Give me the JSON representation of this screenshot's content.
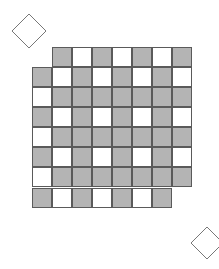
{
  "figure": {
    "colors": {
      "gray": "#b4b4b4",
      "white": "#ffffff",
      "border": "#5a5a5a",
      "diamond_stroke": "#777777"
    },
    "cell_size": 20,
    "grid_origin": {
      "x": 32,
      "y": 47
    },
    "rows": [
      {
        "start_col": 1,
        "cells": [
          "G",
          "W",
          "G",
          "W",
          "G",
          "W",
          "G"
        ]
      },
      {
        "start_col": 0,
        "cells": [
          "G",
          "W",
          "G",
          "W",
          "G",
          "W",
          "G",
          "W"
        ]
      },
      {
        "start_col": 0,
        "cells": [
          "W",
          "G",
          "G",
          "G",
          "G",
          "G",
          "G",
          "G"
        ]
      },
      {
        "start_col": 0,
        "cells": [
          "G",
          "W",
          "G",
          "W",
          "G",
          "W",
          "G",
          "W"
        ]
      },
      {
        "start_col": 0,
        "cells": [
          "W",
          "G",
          "G",
          "G",
          "G",
          "G",
          "G",
          "G"
        ]
      },
      {
        "start_col": 0,
        "cells": [
          "G",
          "W",
          "G",
          "W",
          "G",
          "W",
          "G",
          "W"
        ]
      },
      {
        "start_col": 0,
        "cells": [
          "W",
          "G",
          "G",
          "G",
          "G",
          "G",
          "G",
          "G"
        ]
      },
      {
        "start_col": 0,
        "cells": [
          "G",
          "W",
          "G",
          "W",
          "G",
          "W",
          "G"
        ]
      }
    ],
    "diamonds": [
      {
        "name": "top-left",
        "cx": 29,
        "cy": 31,
        "r": 17
      },
      {
        "name": "bottom-right",
        "cx": 207,
        "cy": 243,
        "r": 16
      }
    ]
  }
}
